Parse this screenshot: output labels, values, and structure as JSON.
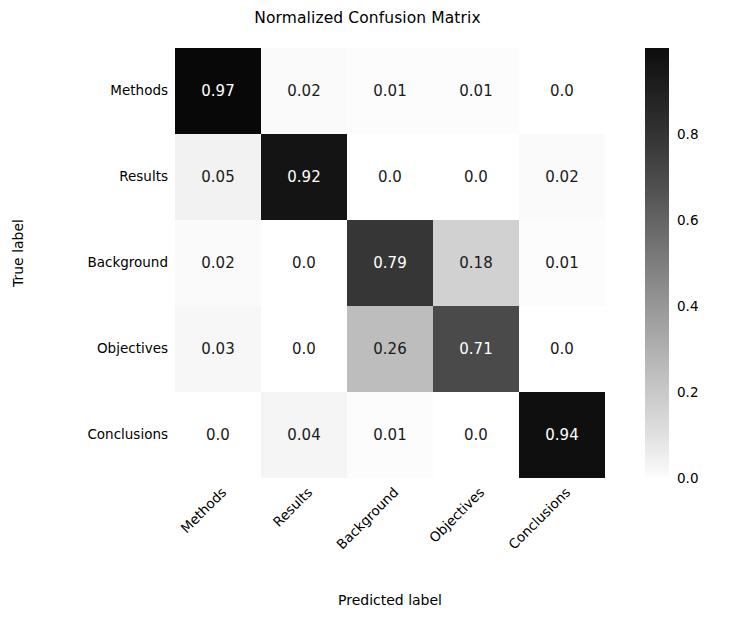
{
  "chart_data": {
    "type": "heatmap",
    "title": "Normalized Confusion Matrix",
    "xlabel": "Predicted label",
    "ylabel": "True label",
    "categories_x": [
      "Methods",
      "Results",
      "Background",
      "Objectives",
      "Conclusions"
    ],
    "categories_y": [
      "Methods",
      "Results",
      "Background",
      "Objectives",
      "Conclusions"
    ],
    "rows": [
      {
        "label": "Methods",
        "values": [
          0.97,
          0.02,
          0.01,
          0.01,
          0.0
        ],
        "cells": [
          "0.97",
          "0.02",
          "0.01",
          "0.01",
          "0.0"
        ]
      },
      {
        "label": "Results",
        "values": [
          0.05,
          0.92,
          0.0,
          0.0,
          0.02
        ],
        "cells": [
          "0.05",
          "0.92",
          "0.0",
          "0.0",
          "0.02"
        ]
      },
      {
        "label": "Background",
        "values": [
          0.02,
          0.0,
          0.79,
          0.18,
          0.01
        ],
        "cells": [
          "0.02",
          "0.0",
          "0.79",
          "0.18",
          "0.01"
        ]
      },
      {
        "label": "Objectives",
        "values": [
          0.03,
          0.0,
          0.26,
          0.71,
          0.0
        ],
        "cells": [
          "0.03",
          "0.0",
          "0.26",
          "0.71",
          "0.0"
        ]
      },
      {
        "label": "Conclusions",
        "values": [
          0.0,
          0.04,
          0.01,
          0.0,
          0.94
        ],
        "cells": [
          "0.0",
          "0.04",
          "0.01",
          "0.0",
          "0.94"
        ]
      }
    ],
    "colormap": "grayscale-reversed",
    "vmin": 0.0,
    "vmax": 1.0,
    "colorbar": {
      "ticks": [
        "0.8",
        "0.6",
        "0.4",
        "0.2",
        "0.0"
      ],
      "tick_values": [
        0.8,
        0.6,
        0.4,
        0.2,
        0.0
      ],
      "position": "right",
      "top_color": "#0d0d0d",
      "bottom_color": "#ffffff"
    },
    "grid": false,
    "text_color_dark": "#1a1a1a",
    "text_color_light": "#ffffff",
    "background": "#ffffff"
  }
}
